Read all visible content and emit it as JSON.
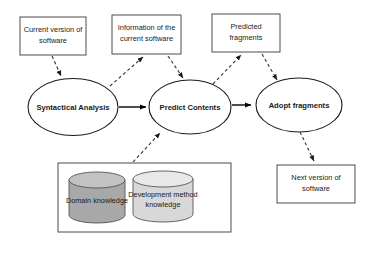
{
  "diagram": {
    "type": "process-flow",
    "colors": {
      "background": "#ffffff",
      "box_stroke": "#4d4d4d",
      "ellipse_stroke": "#1a1a1a",
      "arrow_solid": "#000000",
      "arrow_dashed": "#333333",
      "cylinder_dark_fill": "#a8a8a8",
      "cylinder_light_fill": "#d8d8d8",
      "text": "#1a1a1a"
    },
    "input_boxes": [
      {
        "id": "current-version",
        "line1": "Current version of",
        "line2": "software"
      },
      {
        "id": "information-current",
        "line1": "Information of the",
        "line2": "current software"
      },
      {
        "id": "predicted-fragments",
        "line1": "Predicted",
        "line2": "fragments"
      }
    ],
    "output_box": {
      "id": "next-version",
      "line1": "Next version of",
      "line2": "software"
    },
    "processes": [
      {
        "id": "syntactical-analysis",
        "label": "Syntactical Analysis"
      },
      {
        "id": "predict-contents",
        "label": "Predict Contents"
      },
      {
        "id": "adopt-fragments",
        "label": "Adopt fragments"
      }
    ],
    "knowledge_base": {
      "stores": [
        {
          "id": "domain-knowledge",
          "line1": "Domain knowledge",
          "line2": ""
        },
        {
          "id": "development-method-knowledge",
          "line1": "Development method",
          "line2": "knowledge"
        }
      ]
    },
    "connections": [
      {
        "from": "current-version",
        "to": "syntactical-analysis",
        "style": "dashed"
      },
      {
        "from": "syntactical-analysis",
        "to": "information-current",
        "style": "dashed"
      },
      {
        "from": "syntactical-analysis",
        "to": "predict-contents",
        "style": "solid"
      },
      {
        "from": "information-current",
        "to": "predict-contents",
        "style": "dashed"
      },
      {
        "from": "predict-contents",
        "to": "predicted-fragments",
        "style": "dashed"
      },
      {
        "from": "predict-contents",
        "to": "adopt-fragments",
        "style": "solid"
      },
      {
        "from": "predicted-fragments",
        "to": "adopt-fragments",
        "style": "dashed"
      },
      {
        "from": "knowledge-base",
        "to": "predict-contents",
        "style": "dashed"
      },
      {
        "from": "adopt-fragments",
        "to": "next-version",
        "style": "dashed"
      }
    ]
  }
}
